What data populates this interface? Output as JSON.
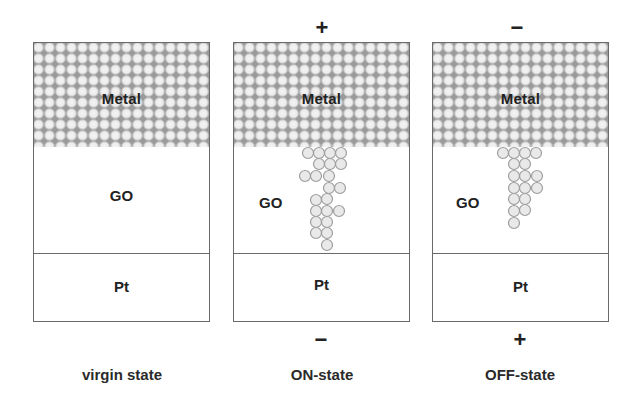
{
  "figure": {
    "type": "resistive-switching-schematic",
    "layers": [
      "Metal",
      "GO",
      "Pt"
    ]
  },
  "panels": [
    {
      "id": "virgin",
      "caption": "virgin state",
      "top_polarity": "",
      "bottom_polarity": "",
      "labels": {
        "metal": "Metal",
        "go": "GO",
        "pt": "Pt"
      },
      "filament": "none"
    },
    {
      "id": "on",
      "caption": "ON-state",
      "top_polarity": "+",
      "bottom_polarity": "−",
      "labels": {
        "metal": "Metal",
        "go": "GO",
        "pt": "Pt"
      },
      "filament": "complete conductive filament bridging Metal to Pt"
    },
    {
      "id": "off",
      "caption": "OFF-state",
      "top_polarity": "−",
      "bottom_polarity": "+",
      "labels": {
        "metal": "Metal",
        "go": "GO",
        "pt": "Pt"
      },
      "filament": "ruptured filament not reaching Pt"
    }
  ],
  "colors": {
    "border": "#6a6a6a",
    "metal_bg": "#9a9a9a",
    "atom_fill": "#e9e9e9",
    "atom_stroke": "#9e9e9e",
    "text": "#222222"
  }
}
